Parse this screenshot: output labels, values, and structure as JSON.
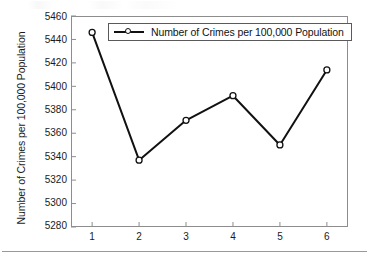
{
  "figure": {
    "background_color": "#ffffff",
    "frame_color": "#8d8d8d",
    "series_color": "#111111",
    "marker_fill": "#ffffff"
  },
  "legend": {
    "position": "top-center-inside",
    "entries": [
      {
        "label": "Number of Crimes per 100,000 Population",
        "marker": "open-circle",
        "line": "solid"
      }
    ]
  },
  "axes": {
    "ylabel": "Number of Crimes per 100,000 Population",
    "xlabel": "",
    "yticks": [
      "5460",
      "5440",
      "5420",
      "5400",
      "5380",
      "5360",
      "5340",
      "5320",
      "5300",
      "5280"
    ],
    "xticks": [
      "1",
      "2",
      "3",
      "4",
      "5",
      "6"
    ]
  },
  "chart_data": {
    "type": "line",
    "title": "",
    "xlabel": "",
    "ylabel": "Number of Crimes per 100,000 Population",
    "categories": [
      "1",
      "2",
      "3",
      "4",
      "5",
      "6"
    ],
    "x": [
      1,
      2,
      3,
      4,
      5,
      6
    ],
    "series": [
      {
        "name": "Number of Crimes per 100,000 Population",
        "values": [
          5446,
          5337,
          5371,
          5392,
          5350,
          5414
        ],
        "color": "#111111",
        "marker": "open-circle",
        "linestyle": "solid"
      }
    ],
    "ylim": [
      5280,
      5460
    ],
    "ytick_step": 20,
    "xlim": [
      0.55,
      6.45
    ],
    "grid": false,
    "legend": true,
    "legend_position": "upper center"
  }
}
